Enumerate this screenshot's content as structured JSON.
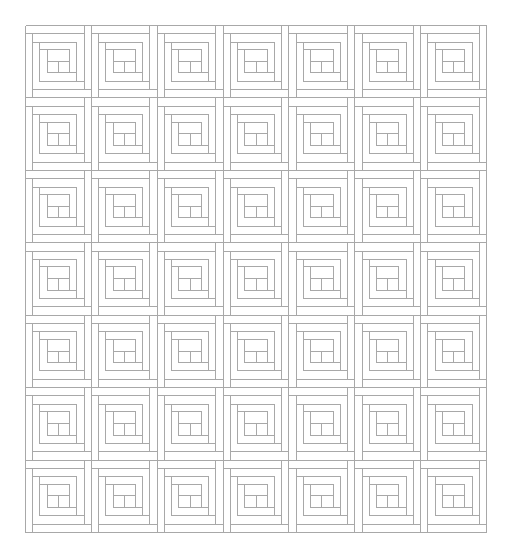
{
  "diagram": {
    "type": "log-cabin-quilt-pattern",
    "rows": 7,
    "cols": 7,
    "origin": [
      25,
      25
    ],
    "width": 461,
    "height": 507,
    "line_color": "#a8a8a8",
    "background": "#ffffff",
    "block_structure": {
      "description": "Each block is a log-cabin spiral: a center square surrounded by successive strips in rings",
      "rings": 3
    }
  }
}
